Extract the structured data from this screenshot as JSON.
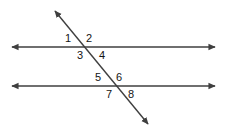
{
  "figure": {
    "canvas": {
      "width": 228,
      "height": 136,
      "background": "#ffffff"
    },
    "stroke_color": "#3f3f3f",
    "label_color": "#141414",
    "stroke_width": 1.4
  },
  "lines": {
    "top_parallel": {
      "name": "top parallel line",
      "x1": 12,
      "y1": 47,
      "x2": 215,
      "y2": 47,
      "arrows": "both"
    },
    "bottom_parallel": {
      "name": "bottom parallel line",
      "x1": 12,
      "y1": 86,
      "x2": 215,
      "y2": 86,
      "arrows": "both"
    },
    "transversal": {
      "name": "transversal line",
      "x1": 55,
      "y1": 11,
      "x2": 148,
      "y2": 124,
      "arrows": "both"
    }
  },
  "intersections": [
    {
      "name": "top intersection",
      "x": 84,
      "y": 47
    },
    {
      "name": "bottom intersection",
      "x": 114,
      "y": 86
    }
  ],
  "angle_labels": [
    {
      "id": "angle-1",
      "text": "1",
      "x": 68,
      "y": 39,
      "position": "above-left of top intersection"
    },
    {
      "id": "angle-2",
      "text": "2",
      "x": 89,
      "y": 39,
      "position": "above-right of top intersection"
    },
    {
      "id": "angle-3",
      "text": "3",
      "x": 80,
      "y": 56,
      "position": "below-left of top intersection"
    },
    {
      "id": "angle-4",
      "text": "4",
      "x": 102,
      "y": 56,
      "position": "below-right of top intersection"
    },
    {
      "id": "angle-5",
      "text": "5",
      "x": 98,
      "y": 78,
      "position": "above-left of bottom intersection"
    },
    {
      "id": "angle-6",
      "text": "6",
      "x": 119,
      "y": 78,
      "position": "above-right of bottom intersection"
    },
    {
      "id": "angle-7",
      "text": "7",
      "x": 109,
      "y": 95,
      "position": "below-left of bottom intersection"
    },
    {
      "id": "angle-8",
      "text": "8",
      "x": 131,
      "y": 95,
      "position": "below-right of bottom intersection"
    }
  ]
}
